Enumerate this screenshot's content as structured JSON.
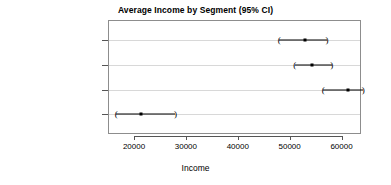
{
  "chart_data": {
    "type": "scatter",
    "title": "Average Income by Segment (95% CI)",
    "xlabel": "Income",
    "ylabel": "",
    "xlim": [
      13500,
      66500
    ],
    "xticks": [
      20000,
      30000,
      40000,
      50000,
      60000
    ],
    "xticklabels": [
      "20000",
      "30000",
      "40000",
      "50000",
      "60000"
    ],
    "grid": false,
    "legend": null,
    "orientation": "horizontal",
    "categories": [
      "SegmentMoving up",
      "SegmentSuburb mix",
      "SegmentTravelers",
      "SegmentUrban hip"
    ],
    "series": [
      {
        "name": "Average Income",
        "values": [
          53000,
          54400,
          61200,
          21300
        ],
        "ci_lower": [
          48000,
          51000,
          56500,
          16600
        ],
        "ci_upper": [
          57200,
          58100,
          64200,
          28000
        ]
      }
    ],
    "points": [
      {
        "category": "SegmentMoving up",
        "estimate": 53000,
        "lower": 48000,
        "upper": 57200
      },
      {
        "category": "SegmentSuburb mix",
        "estimate": 54400,
        "lower": 51000,
        "upper": 58100
      },
      {
        "category": "SegmentTravelers",
        "estimate": 61200,
        "lower": 56500,
        "upper": 64200
      },
      {
        "category": "SegmentUrban hip",
        "estimate": 21300,
        "lower": 16600,
        "upper": 28000
      }
    ],
    "cap_glyph_left": "(",
    "cap_glyph_right": ")"
  }
}
